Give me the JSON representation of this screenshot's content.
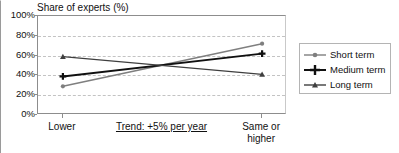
{
  "chart_data": {
    "type": "line",
    "title": "",
    "ylabel": "Share of experts (%)",
    "xlabel": "Trend: +5% per year",
    "categories": [
      "Lower",
      "Same or higher"
    ],
    "x": [
      0,
      1
    ],
    "ylim": [
      0,
      100
    ],
    "ytick_labels": [
      "100%",
      "80%",
      "60%",
      "40%",
      "20%",
      "0%"
    ],
    "ytick_values": [
      100,
      80,
      60,
      40,
      20,
      0
    ],
    "grid": true,
    "legend_position": "right",
    "series": [
      {
        "name": "Short term",
        "values": [
          29,
          72
        ],
        "color": "#7f7f7f",
        "marker": "circle"
      },
      {
        "name": "Medium term",
        "values": [
          39,
          62
        ],
        "color": "#101010",
        "marker": "plus"
      },
      {
        "name": "Long term",
        "values": [
          59,
          41
        ],
        "color": "#3f3f3f",
        "marker": "triangle"
      }
    ]
  },
  "axes": {
    "y_title": "Share of experts (%)",
    "x_categories": [
      {
        "label_line1": "Lower",
        "label_line2": ""
      },
      {
        "label_line1": "Same or",
        "label_line2": "higher"
      }
    ],
    "x_center_note": "Trend: +5% per year"
  },
  "legend": {
    "items": [
      {
        "label": "Short term"
      },
      {
        "label": "Medium term"
      },
      {
        "label": "Long term"
      }
    ]
  },
  "colors": {
    "short_term": "#7f7f7f",
    "medium_term": "#101010",
    "long_term": "#3f3f3f",
    "grid": "#c3c3c3",
    "axis": "#8d8d8d"
  }
}
